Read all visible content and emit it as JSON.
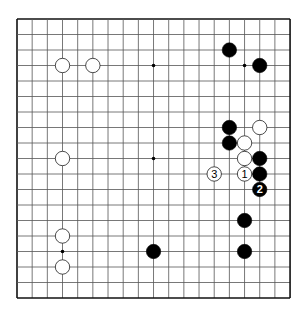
{
  "board": {
    "size": 19,
    "origin": {
      "x": 17,
      "y": 19
    },
    "spacing": {
      "x": 15.17,
      "y": 15.5
    },
    "line_color": "#555555",
    "border_color": "#111111"
  },
  "star_points": [
    [
      9,
      3
    ],
    [
      15,
      3
    ],
    [
      9,
      9
    ],
    [
      3,
      15
    ]
  ],
  "stones": [
    {
      "col": 14,
      "row": 2,
      "color": "black",
      "label": ""
    },
    {
      "col": 16,
      "row": 3,
      "color": "black",
      "label": ""
    },
    {
      "col": 3,
      "row": 3,
      "color": "white",
      "label": ""
    },
    {
      "col": 5,
      "row": 3,
      "color": "white",
      "label": ""
    },
    {
      "col": 14,
      "row": 7,
      "color": "black",
      "label": ""
    },
    {
      "col": 16,
      "row": 7,
      "color": "white",
      "label": ""
    },
    {
      "col": 14,
      "row": 8,
      "color": "black",
      "label": ""
    },
    {
      "col": 15,
      "row": 8,
      "color": "white",
      "label": ""
    },
    {
      "col": 3,
      "row": 9,
      "color": "white",
      "label": ""
    },
    {
      "col": 15,
      "row": 9,
      "color": "white",
      "label": ""
    },
    {
      "col": 16,
      "row": 9,
      "color": "black",
      "label": ""
    },
    {
      "col": 13,
      "row": 10,
      "color": "white",
      "label": "3"
    },
    {
      "col": 15,
      "row": 10,
      "color": "white",
      "label": "1"
    },
    {
      "col": 16,
      "row": 10,
      "color": "black",
      "label": ""
    },
    {
      "col": 16,
      "row": 11,
      "color": "black",
      "label": "2"
    },
    {
      "col": 15,
      "row": 13,
      "color": "black",
      "label": ""
    },
    {
      "col": 3,
      "row": 14,
      "color": "white",
      "label": ""
    },
    {
      "col": 9,
      "row": 15,
      "color": "black",
      "label": ""
    },
    {
      "col": 15,
      "row": 15,
      "color": "black",
      "label": ""
    },
    {
      "col": 3,
      "row": 16,
      "color": "white",
      "label": ""
    }
  ]
}
